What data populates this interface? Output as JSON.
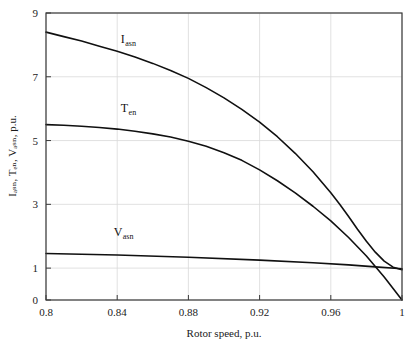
{
  "chart_data": {
    "type": "line",
    "title": "",
    "xlabel": "Rotor speed, p.u.",
    "ylabel": "Iₐₛₙ, Tₑₙ, Vₐₛₙ, p.u.",
    "xlim": [
      0.8,
      1.0
    ],
    "ylim": [
      0,
      9
    ],
    "xticks": [
      0.8,
      0.84,
      0.88,
      0.92,
      0.96,
      1.0
    ],
    "xtick_labels": [
      "0.8",
      "0.84",
      "0.88",
      "0.92",
      "0.96",
      "1"
    ],
    "yticks": [
      0,
      1,
      3,
      5,
      7,
      9
    ],
    "ytick_labels": [
      "0",
      "1",
      "3",
      "5",
      "7",
      "9"
    ],
    "grid": true,
    "grid_color": "#d9d9d9",
    "axis_color": "#3a3a3a",
    "line_color": "#101010",
    "background": "#ffffff",
    "legend": "inline-annotations",
    "series": [
      {
        "name": "Iasn",
        "label_main": "I",
        "label_sub": "asn",
        "label_x": 0.842,
        "label_y": 8.05,
        "x": [
          0.8,
          0.81,
          0.82,
          0.83,
          0.84,
          0.85,
          0.86,
          0.87,
          0.88,
          0.89,
          0.9,
          0.91,
          0.92,
          0.93,
          0.94,
          0.95,
          0.96,
          0.965,
          0.97,
          0.975,
          0.98,
          0.985,
          0.99,
          0.995,
          1.0
        ],
        "y": [
          8.4,
          8.26,
          8.12,
          7.96,
          7.8,
          7.62,
          7.42,
          7.2,
          6.95,
          6.66,
          6.34,
          5.98,
          5.58,
          5.12,
          4.6,
          4.02,
          3.36,
          3.0,
          2.62,
          2.22,
          1.84,
          1.5,
          1.22,
          1.03,
          0.95
        ]
      },
      {
        "name": "Ten",
        "label_main": "T",
        "label_sub": "en",
        "label_x": 0.842,
        "label_y": 5.9,
        "x": [
          0.8,
          0.81,
          0.82,
          0.83,
          0.84,
          0.85,
          0.86,
          0.87,
          0.88,
          0.89,
          0.9,
          0.91,
          0.92,
          0.93,
          0.94,
          0.95,
          0.96,
          0.97,
          0.98,
          0.99,
          1.0
        ],
        "y": [
          5.5,
          5.48,
          5.45,
          5.41,
          5.36,
          5.29,
          5.21,
          5.11,
          4.98,
          4.82,
          4.62,
          4.38,
          4.08,
          3.74,
          3.36,
          2.94,
          2.48,
          1.96,
          1.38,
          0.72,
          0.0
        ]
      },
      {
        "name": "Vasn",
        "label_main": "V",
        "label_sub": "asn",
        "label_x": 0.838,
        "label_y": 2.0,
        "x": [
          0.8,
          0.84,
          0.88,
          0.92,
          0.95,
          0.97,
          0.985,
          1.0
        ],
        "y": [
          1.46,
          1.41,
          1.34,
          1.25,
          1.17,
          1.1,
          1.04,
          0.98
        ]
      }
    ]
  }
}
